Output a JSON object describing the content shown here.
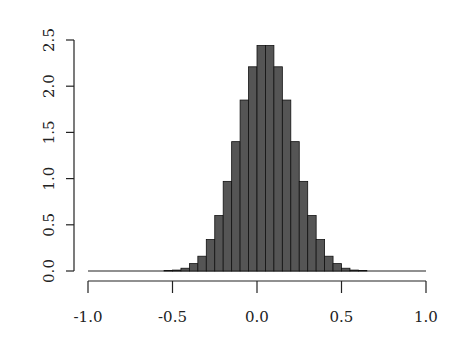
{
  "chart_data": {
    "type": "bar",
    "subtype": "histogram",
    "title": "",
    "xlabel": "",
    "ylabel": "",
    "xlim": [
      -1.0,
      1.0
    ],
    "ylim": [
      0,
      2.5
    ],
    "x_ticks": [
      "-1.0",
      "-0.5",
      "0.0",
      "0.5",
      "1.0"
    ],
    "y_ticks": [
      "0.0",
      "0.5",
      "1.0",
      "1.5",
      "2.0",
      "2.5"
    ],
    "bin_width": 0.05,
    "bin_edges": [
      -1.0,
      -0.95,
      -0.9,
      -0.85,
      -0.8,
      -0.75,
      -0.7,
      -0.65,
      -0.6,
      -0.55,
      -0.5,
      -0.45,
      -0.4,
      -0.35,
      -0.3,
      -0.25,
      -0.2,
      -0.15,
      -0.1,
      -0.05,
      0.0,
      0.05,
      0.1,
      0.15,
      0.2,
      0.25,
      0.3,
      0.35,
      0.4,
      0.45,
      0.5,
      0.55,
      0.6,
      0.65,
      0.7,
      0.75,
      0.8,
      0.85,
      0.9,
      0.95,
      1.0
    ],
    "values": [
      0,
      0,
      0,
      0,
      0,
      0,
      0,
      0,
      0,
      0.005,
      0.01,
      0.03,
      0.08,
      0.16,
      0.34,
      0.6,
      0.97,
      1.4,
      1.85,
      2.21,
      2.44,
      2.44,
      2.21,
      1.85,
      1.4,
      0.97,
      0.6,
      0.34,
      0.16,
      0.08,
      0.03,
      0.01,
      0.005,
      0,
      0,
      0,
      0,
      0,
      0,
      0
    ],
    "bar_color": "#555555",
    "bar_edge_color": "#111111",
    "grid": false,
    "legend": null
  }
}
